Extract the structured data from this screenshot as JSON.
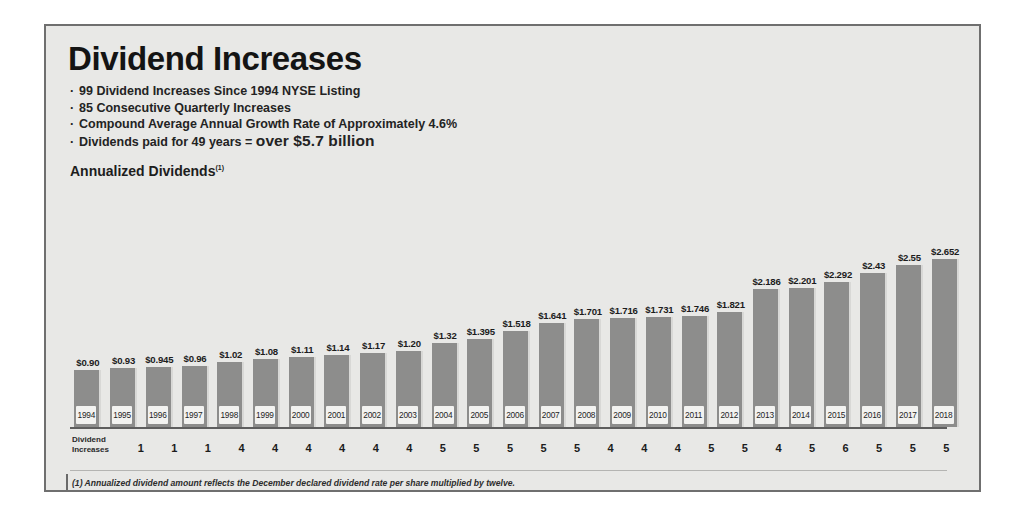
{
  "title": "Dividend Increases",
  "bullets": [
    {
      "text": "99 Dividend Increases Since 1994 NYSE Listing",
      "emphasis": ""
    },
    {
      "text": "85 Consecutive Quarterly Increases",
      "emphasis": ""
    },
    {
      "text": "Compound Average Annual Growth Rate of Approximately 4.6%",
      "emphasis": ""
    },
    {
      "text": "Dividends paid for 49 years = ",
      "emphasis": "over $5.7 billion"
    }
  ],
  "section_label": "Annualized Dividends",
  "section_label_superscript": "(1)",
  "increases_row_label_line1": "Dividend",
  "increases_row_label_line2": "Increases",
  "footnote": "(1) Annualized dividend amount reflects the December declared dividend rate per share multiplied by twelve.",
  "colors": {
    "bar": "#8d8d8c",
    "background": "#e8e8e6",
    "border": "#6f6f6f",
    "text": "#1c1c1c",
    "year_box": "#f2f2f0"
  },
  "chart_data": {
    "type": "bar",
    "title": "Annualized Dividends",
    "xlabel": "",
    "ylabel": "",
    "ylim": [
      0,
      2.652
    ],
    "grid": false,
    "legend": "none",
    "categories": [
      "1994",
      "1995",
      "1996",
      "1997",
      "1998",
      "1999",
      "2000",
      "2001",
      "2002",
      "2003",
      "2004",
      "2005",
      "2006",
      "2007",
      "2008",
      "2009",
      "2010",
      "2011",
      "2012",
      "2013",
      "2014",
      "2015",
      "2016",
      "2017",
      "2018"
    ],
    "values": [
      0.9,
      0.93,
      0.945,
      0.96,
      1.02,
      1.08,
      1.11,
      1.14,
      1.17,
      1.2,
      1.32,
      1.395,
      1.518,
      1.641,
      1.701,
      1.716,
      1.731,
      1.746,
      1.821,
      2.186,
      2.201,
      2.292,
      2.43,
      2.55,
      2.652
    ],
    "value_labels": [
      "$0.90",
      "$0.93",
      "$0.945",
      "$0.96",
      "$1.02",
      "$1.08",
      "$1.11",
      "$1.14",
      "$1.17",
      "$1.20",
      "$1.32",
      "$1.395",
      "$1.518",
      "$1.641",
      "$1.701",
      "$1.716",
      "$1.731",
      "$1.746",
      "$1.821",
      "$2.186",
      "$2.201",
      "$2.292",
      "$2.43",
      "$2.55",
      "$2.652"
    ],
    "series": [
      {
        "name": "Annualized Dividends",
        "values": [
          0.9,
          0.93,
          0.945,
          0.96,
          1.02,
          1.08,
          1.11,
          1.14,
          1.17,
          1.2,
          1.32,
          1.395,
          1.518,
          1.641,
          1.701,
          1.716,
          1.731,
          1.746,
          1.821,
          2.186,
          2.201,
          2.292,
          2.43,
          2.55,
          2.652
        ]
      },
      {
        "name": "Dividend Increases",
        "values": [
          1,
          1,
          1,
          4,
          4,
          4,
          4,
          4,
          4,
          5,
          5,
          5,
          5,
          5,
          4,
          4,
          4,
          5,
          5,
          4,
          5,
          6,
          5,
          5,
          5
        ]
      }
    ],
    "dividend_increases": [
      1,
      1,
      1,
      4,
      4,
      4,
      4,
      4,
      4,
      5,
      5,
      5,
      5,
      5,
      4,
      4,
      4,
      5,
      5,
      4,
      5,
      6,
      5,
      5,
      5
    ],
    "annotations": [
      "99 Dividend Increases Since 1994 NYSE Listing",
      "85 Consecutive Quarterly Increases",
      "Compound Average Annual Growth Rate of Approximately 4.6%",
      "Dividends paid for 49 years = over $5.7 billion"
    ]
  }
}
